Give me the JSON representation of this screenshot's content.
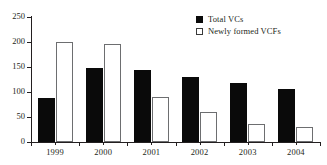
{
  "chart_data": {
    "type": "bar",
    "title": "",
    "subtitle": "",
    "xlabel": "",
    "ylabel": "",
    "categories": [
      "1999",
      "2000",
      "2001",
      "2002",
      "2003",
      "2004"
    ],
    "series": [
      {
        "name": "Total VCs",
        "values": [
          88,
          148,
          145,
          130,
          118,
          106
        ],
        "color": "#0a0a0a",
        "fill": "solid"
      },
      {
        "name": "Newly formed VCFs",
        "values": [
          200,
          196,
          91,
          60,
          36,
          30
        ],
        "color": "#ffffff",
        "fill": "outline"
      }
    ],
    "ylim": [
      0,
      250
    ],
    "yticks": [
      0,
      50,
      100,
      150,
      200,
      250
    ],
    "ytick_labels": [
      "0",
      "50",
      "100",
      "150",
      "200",
      "250"
    ],
    "grid": false,
    "legend_position": "top-right"
  },
  "legend": {
    "items": [
      {
        "label": "Total VCs",
        "swatch": "filled-square-icon"
      },
      {
        "label": "Newly formed VCFs",
        "swatch": "open-square-icon"
      }
    ]
  }
}
